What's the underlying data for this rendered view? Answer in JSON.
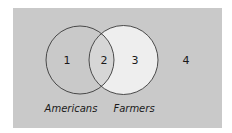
{
  "diagram": {
    "type": "venn",
    "colors": {
      "background_panel": "#c9c9c9",
      "set_a_fill": "#c9c9c9",
      "set_b_fill": "#eeeeee",
      "intersection_fill": "#d6d6d6",
      "stroke": "#3a3a3a"
    },
    "sets": [
      {
        "label": "Americans"
      },
      {
        "label": "Farmers"
      }
    ],
    "regions": [
      {
        "label": "1",
        "description": "Americans only"
      },
      {
        "label": "2",
        "description": "Americans and Farmers"
      },
      {
        "label": "3",
        "description": "Farmers only"
      },
      {
        "label": "4",
        "description": "Neither"
      }
    ]
  }
}
